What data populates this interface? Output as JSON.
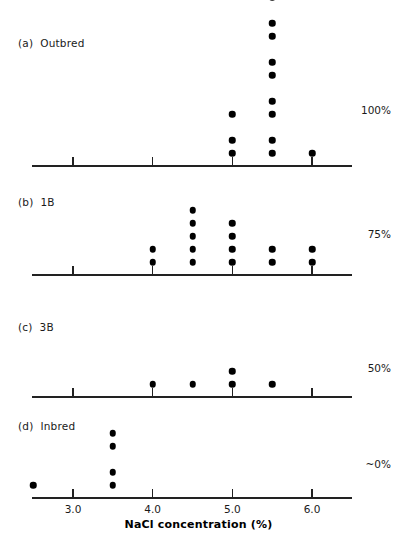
{
  "chart_data": {
    "type": "scatter",
    "plot_style": "dot-plot",
    "title": "",
    "xlabel": "NaCl concentration (%)",
    "ylabel": "",
    "xlim": [
      2.25,
      6.5
    ],
    "xticks": [
      3.0,
      4.0,
      5.0,
      6.0
    ],
    "xtick_labels": [
      "3.0",
      "4.0",
      "5.0",
      "6.0"
    ],
    "grid": false,
    "legend": "none",
    "dot_color": "#000000",
    "axis_color": "#222222",
    "panels": [
      {
        "tag": "(a)",
        "name": "Outbred",
        "annotation": "100%",
        "x": [
          5.0,
          5.5,
          6.0
        ],
        "counts": [
          3,
          9,
          1
        ],
        "points": [
          {
            "x": 5.0,
            "n": 3
          },
          {
            "x": 5.5,
            "n": 9
          },
          {
            "x": 6.0,
            "n": 1
          }
        ]
      },
      {
        "tag": "(b)",
        "name": "1B",
        "annotation": "75%",
        "x": [
          4.0,
          4.5,
          5.0,
          5.5,
          6.0
        ],
        "counts": [
          2,
          5,
          4,
          2,
          2
        ],
        "points": [
          {
            "x": 4.0,
            "n": 2
          },
          {
            "x": 4.5,
            "n": 5
          },
          {
            "x": 5.0,
            "n": 4
          },
          {
            "x": 5.5,
            "n": 2
          },
          {
            "x": 6.0,
            "n": 2
          }
        ]
      },
      {
        "tag": "(c)",
        "name": "3B",
        "annotation": "50%",
        "x": [
          4.0,
          4.5,
          5.0,
          5.5
        ],
        "counts": [
          1,
          1,
          2,
          1
        ],
        "points": [
          {
            "x": 4.0,
            "n": 1
          },
          {
            "x": 4.5,
            "n": 1
          },
          {
            "x": 5.0,
            "n": 2
          },
          {
            "x": 5.5,
            "n": 1
          }
        ]
      },
      {
        "tag": "(d)",
        "name": "Inbred",
        "annotation": "~0%",
        "x": [
          2.5,
          3.5
        ],
        "counts": [
          1,
          4
        ],
        "points": [
          {
            "x": 2.5,
            "n": 1
          },
          {
            "x": 3.5,
            "n": 4
          }
        ]
      }
    ]
  }
}
